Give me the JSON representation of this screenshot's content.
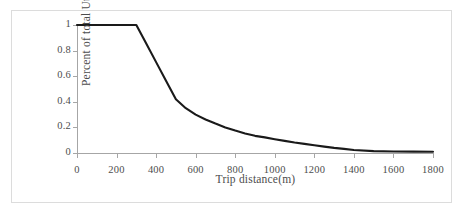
{
  "chart_data": {
    "type": "line",
    "title": "",
    "xlabel": "Trip distance(m)",
    "ylabel": "Percent of total Utility",
    "xlim": [
      0,
      1800
    ],
    "ylim": [
      0,
      1
    ],
    "grid": false,
    "legend": "none",
    "line_color": "#1a1a1a",
    "line_width_px": 2.1,
    "xticks": [
      0,
      200,
      400,
      600,
      800,
      1000,
      1200,
      1400,
      1600,
      1800
    ],
    "xtick_labels": [
      "0",
      "200",
      "400",
      "600",
      "800",
      "1000",
      "1200",
      "1400",
      "1600",
      "1800"
    ],
    "yticks": [
      0,
      0.2,
      0.4,
      0.6,
      0.8,
      1
    ],
    "ytick_labels": [
      "0",
      "0.2",
      "0.4",
      "0.6",
      "0.8",
      "1"
    ],
    "series": [
      {
        "name": "utility-decay",
        "x": [
          0,
          100,
          200,
          300,
          350,
          400,
          450,
          500,
          550,
          600,
          650,
          700,
          750,
          800,
          850,
          900,
          950,
          1000,
          1050,
          1100,
          1150,
          1200,
          1250,
          1300,
          1350,
          1400,
          1500,
          1600,
          1700,
          1800
        ],
        "values": [
          1,
          1,
          1,
          1,
          0.855,
          0.71,
          0.565,
          0.42,
          0.35,
          0.3,
          0.262,
          0.23,
          0.2,
          0.175,
          0.153,
          0.134,
          0.122,
          0.108,
          0.095,
          0.082,
          0.071,
          0.061,
          0.05,
          0.04,
          0.032,
          0.024,
          0.015,
          0.012,
          0.011,
          0.01
        ]
      }
    ],
    "annotations": [
      {
        "text": "plateau at 1.0 from 0 m to 300 m"
      },
      {
        "text": "linear descent 300 m to 500 m"
      },
      {
        "text": "exponential decay tail approaching 0 after 1400 m"
      }
    ]
  },
  "figure": {
    "background_color": "#ffffff",
    "frame_color": "#dcdcdc",
    "axis_color": "#a6a6a6",
    "tick_label_color": "#4d4d4d"
  }
}
